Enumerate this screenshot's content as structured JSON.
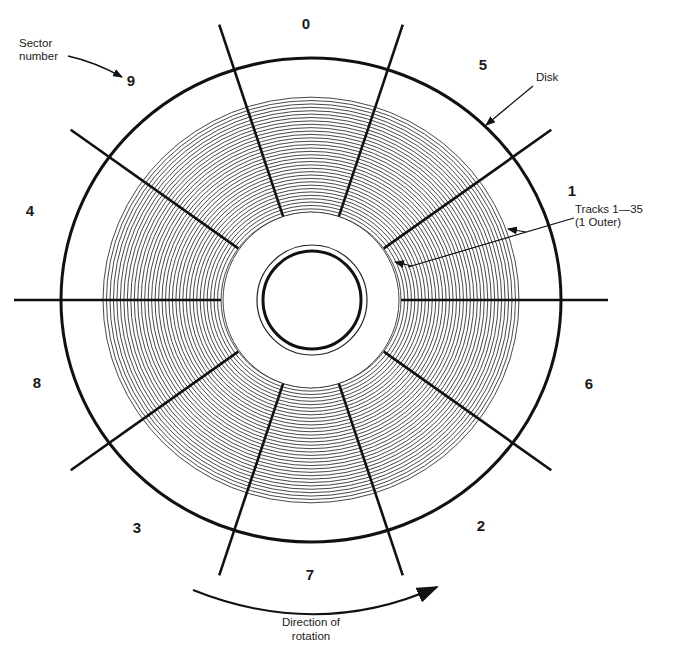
{
  "diagram": {
    "center": [
      311,
      300
    ],
    "disk": {
      "rx": 250,
      "ry": 242,
      "stroke": "#111111"
    },
    "tracks": {
      "count": 35,
      "inner_radius": 90,
      "outer_radius": 208,
      "label": "Tracks 1—35",
      "sublabel": "(1 Outer)"
    },
    "hub": {
      "inner_radius": 49,
      "outer_radius": 55
    },
    "sector_lines_angles_deg": [
      0,
      36,
      72,
      108,
      144
    ],
    "sectors": [
      {
        "label": "0",
        "x": 306,
        "y": 29
      },
      {
        "label": "5",
        "x": 483,
        "y": 70
      },
      {
        "label": "1",
        "x": 572,
        "y": 196
      },
      {
        "label": "6",
        "x": 589,
        "y": 389
      },
      {
        "label": "2",
        "x": 481,
        "y": 531
      },
      {
        "label": "7",
        "x": 310,
        "y": 580
      },
      {
        "label": "3",
        "x": 137,
        "y": 533
      },
      {
        "label": "8",
        "x": 37,
        "y": 388
      },
      {
        "label": "4",
        "x": 30,
        "y": 216
      },
      {
        "label": "9",
        "x": 131,
        "y": 86
      }
    ],
    "annotations": {
      "sector_number_line1": "Sector",
      "sector_number_line2": "number",
      "disk": "Disk",
      "direction_line1": "Direction of",
      "direction_line2": "rotation"
    }
  }
}
